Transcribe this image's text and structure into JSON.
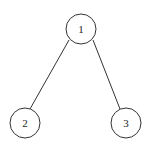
{
  "diagram": {
    "type": "tree",
    "nodes": [
      {
        "id": "1",
        "label": "1"
      },
      {
        "id": "2",
        "label": "2"
      },
      {
        "id": "3",
        "label": "3"
      }
    ],
    "edges": [
      {
        "from": "1",
        "to": "2"
      },
      {
        "from": "1",
        "to": "3"
      }
    ],
    "colors": {
      "stroke": "#333333",
      "fill": "#ffffff",
      "text": "#222222"
    }
  }
}
